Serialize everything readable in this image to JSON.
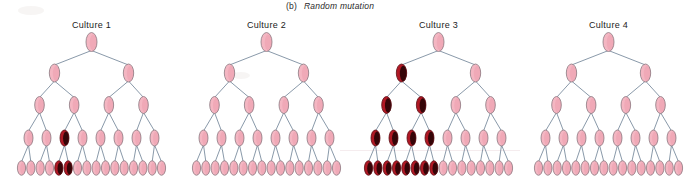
{
  "figure": {
    "panel_label": "(b)",
    "panel_caption": "Random mutation",
    "background_color": "#ffffff",
    "normal_cell_color": "#f4b6c2",
    "mutant_cell_color": "#b01824",
    "branch_color": "#6b7f93",
    "outline_color": "#8c7a82"
  },
  "chart_data": {
    "type": "diagram",
    "title": "Random mutation",
    "subtitle": "(b)",
    "legend": [
      {
        "name": "normal cell",
        "color": "#f4b6c2"
      },
      {
        "name": "mutant cell",
        "color": "#b01824"
      }
    ],
    "generations": [
      1,
      2,
      4,
      8,
      16
    ],
    "categories": [
      "Culture 1",
      "Culture 2",
      "Culture 3",
      "Culture 4"
    ],
    "values": [
      2,
      0,
      8,
      0
    ],
    "ylabel": "mutant cells in final generation",
    "series": [
      {
        "name": "mutant cells in final generation",
        "values": [
          2,
          0,
          8,
          0
        ]
      },
      {
        "name": "total cells in final generation",
        "values": [
          16,
          16,
          16,
          16
        ]
      }
    ]
  },
  "cultures": [
    {
      "id": "culture-1",
      "title": "Culture 1",
      "mutant_count_final": 2,
      "mutation_generation": 4,
      "rows": [
        {
          "generation": 1,
          "count": 1,
          "mutants": []
        },
        {
          "generation": 2,
          "count": 2,
          "mutants": []
        },
        {
          "generation": 3,
          "count": 4,
          "mutants": []
        },
        {
          "generation": 4,
          "count": 8,
          "mutants": [
            2
          ]
        },
        {
          "generation": 5,
          "count": 16,
          "mutants": [
            4,
            5
          ]
        }
      ]
    },
    {
      "id": "culture-2",
      "title": "Culture 2",
      "mutant_count_final": 0,
      "mutation_generation": 0,
      "rows": [
        {
          "generation": 1,
          "count": 1,
          "mutants": []
        },
        {
          "generation": 2,
          "count": 2,
          "mutants": []
        },
        {
          "generation": 3,
          "count": 4,
          "mutants": []
        },
        {
          "generation": 4,
          "count": 8,
          "mutants": []
        },
        {
          "generation": 5,
          "count": 16,
          "mutants": []
        }
      ]
    },
    {
      "id": "culture-3",
      "title": "Culture 3",
      "mutant_count_final": 8,
      "mutation_generation": 2,
      "rows": [
        {
          "generation": 1,
          "count": 1,
          "mutants": []
        },
        {
          "generation": 2,
          "count": 2,
          "mutants": [
            0
          ]
        },
        {
          "generation": 3,
          "count": 4,
          "mutants": [
            0,
            1
          ]
        },
        {
          "generation": 4,
          "count": 8,
          "mutants": [
            0,
            1,
            2,
            3
          ]
        },
        {
          "generation": 5,
          "count": 16,
          "mutants": [
            0,
            1,
            2,
            3,
            4,
            5,
            6,
            7
          ]
        }
      ]
    },
    {
      "id": "culture-4",
      "title": "Culture 4",
      "mutant_count_final": 0,
      "mutation_generation": 0,
      "rows": [
        {
          "generation": 1,
          "count": 1,
          "mutants": []
        },
        {
          "generation": 2,
          "count": 2,
          "mutants": []
        },
        {
          "generation": 3,
          "count": 4,
          "mutants": []
        },
        {
          "generation": 4,
          "count": 8,
          "mutants": []
        },
        {
          "generation": 5,
          "count": 16,
          "mutants": []
        }
      ]
    }
  ]
}
